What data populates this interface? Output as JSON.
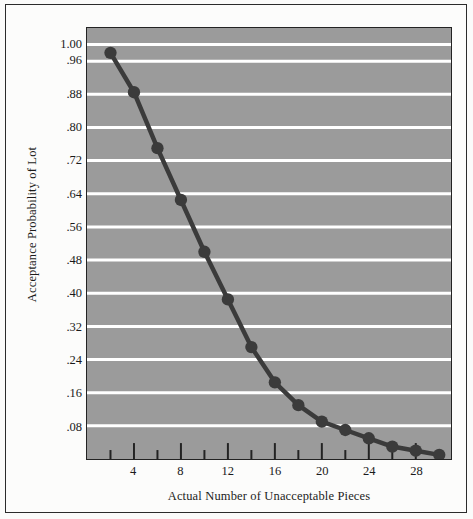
{
  "chart_data": {
    "type": "line",
    "title": "",
    "subtitle": "",
    "xlabel": "Actual Number of Unacceptable Pieces",
    "ylabel": "Acceptance Probability of Lot",
    "x": [
      2,
      4,
      6,
      8,
      10,
      12,
      14,
      16,
      18,
      20,
      22,
      24,
      26,
      28,
      30
    ],
    "series": [
      {
        "name": "Acceptance Probability",
        "values": [
          0.98,
          0.885,
          0.75,
          0.625,
          0.5,
          0.385,
          0.27,
          0.185,
          0.13,
          0.09,
          0.07,
          0.05,
          0.03,
          0.02,
          0.01
        ],
        "color": "#3b3b3b",
        "marker": "circle"
      }
    ],
    "xlim": [
      0,
      31
    ],
    "ylim": [
      0,
      1.04
    ],
    "xticks": [
      2,
      4,
      6,
      8,
      10,
      12,
      14,
      16,
      18,
      20,
      22,
      24,
      26,
      28,
      30
    ],
    "xtick_labels": [
      "",
      "4",
      "",
      "8",
      "",
      "12",
      "",
      "16",
      "",
      "20",
      "",
      "24",
      "",
      "28",
      ""
    ],
    "yticks": [
      0.08,
      0.16,
      0.24,
      0.32,
      0.4,
      0.48,
      0.56,
      0.64,
      0.72,
      0.8,
      0.88,
      0.96,
      1.0
    ],
    "ytick_labels": [
      ".08",
      ".16",
      ".24",
      ".32",
      ".40",
      ".48",
      ".56",
      ".64",
      ".72",
      ".80",
      ".88",
      ".96",
      "1.00"
    ],
    "grid": "horizontal",
    "gridline_color": "#ffffff",
    "plot_background": "#9b9b9b",
    "legend": "none",
    "annotations": []
  },
  "axes": {
    "y_title": "Acceptance Probability of Lot",
    "x_title": "Actual Number of Unacceptable Pieces",
    "y_labels": [
      "1.00",
      ".96",
      ".88",
      ".80",
      ".72",
      ".64",
      ".56",
      ".48",
      ".40",
      ".32",
      ".24",
      ".16",
      ".08"
    ],
    "x_labels": [
      "4",
      "8",
      "12",
      "16",
      "20",
      "24",
      "28"
    ]
  },
  "colors": {
    "page_background": "#fcfcfb",
    "border": "#2b2b2b",
    "plot_fill": "#9b9b9b",
    "grid": "#ffffff",
    "line": "#3b3b3b",
    "marker": "#2e2e2e",
    "text": "#1a1a1a"
  }
}
